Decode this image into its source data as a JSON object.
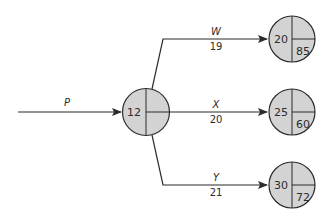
{
  "diagram": {
    "type": "network-activity-diagram",
    "colors": {
      "node_fill": "#d3d3d3",
      "stroke": "#2b2b2b",
      "text": "#2b2b2b"
    },
    "nodes": [
      {
        "id": "start",
        "left": "12",
        "upper_right": "",
        "lower_right": ""
      },
      {
        "id": "top",
        "left": "20",
        "upper_right": "",
        "lower_right": "85"
      },
      {
        "id": "middle",
        "left": "25",
        "upper_right": "",
        "lower_right": "60"
      },
      {
        "id": "bottom",
        "left": "30",
        "upper_right": "",
        "lower_right": "72"
      }
    ],
    "activities": [
      {
        "id": "P",
        "label": "P",
        "duration": "",
        "from": "",
        "to": "start"
      },
      {
        "id": "W",
        "label": "W",
        "duration": "19",
        "from": "start",
        "to": "top"
      },
      {
        "id": "X",
        "label": "X",
        "duration": "20",
        "from": "start",
        "to": "middle"
      },
      {
        "id": "Y",
        "label": "Y",
        "duration": "21",
        "from": "start",
        "to": "bottom"
      }
    ]
  }
}
